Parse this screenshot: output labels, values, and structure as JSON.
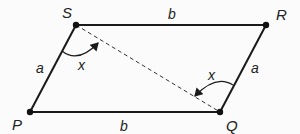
{
  "diagram": {
    "type": "parallelogram",
    "vertices": {
      "S": "S",
      "R": "R",
      "P": "P",
      "Q": "Q"
    },
    "sides": {
      "top": "b",
      "bottom": "b",
      "left": "a",
      "right": "a"
    },
    "diagonal": "SQ (dashed)",
    "angles": {
      "at_S": "x",
      "at_Q": "x"
    },
    "colors": {
      "line": "#1a1a1a",
      "background": "#fbfbfb"
    }
  }
}
